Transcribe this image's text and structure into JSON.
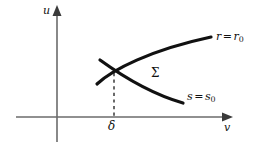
{
  "figure": {
    "kind": "characteristic-curve-diagram",
    "background_color": "#ffffff",
    "ink_color": "#111111",
    "axis_color": "#6b6b6b",
    "axes": {
      "vertical_label": "u",
      "horizontal_label": "v",
      "origin_x": 57,
      "origin_y": 117
    },
    "tick": {
      "label": "δ",
      "x": 114
    },
    "region": {
      "label": "Σ"
    },
    "curves": [
      {
        "name": "upper-characteristic",
        "label_var": "r",
        "label_eq": "=",
        "label_value": "r",
        "label_sub": "0",
        "label_full": "r = r₀",
        "path": "M 97 84 C 112 70, 150 50, 211 37"
      },
      {
        "name": "lower-characteristic",
        "label_var": "s",
        "label_eq": "=",
        "label_value": "s",
        "label_sub": "0",
        "label_full": "s = s₀",
        "path": "M 100 60 C 118 73, 148 93, 183 103"
      }
    ],
    "dashed_line": {
      "name": "delta-drop-line",
      "x": 114,
      "y_top": 73,
      "y_bottom": 117
    }
  }
}
